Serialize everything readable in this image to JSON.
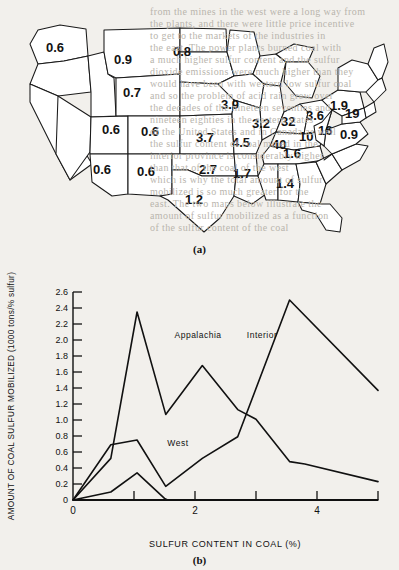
{
  "page": {
    "background_color": "#f2f0ec",
    "ink_color": "#121212",
    "bleed_through_lines": [
      {
        "text": "from the mines in the west were a long way from",
        "x": 150,
        "y": 6
      },
      {
        "text": "the plants, and there were little price incentive",
        "x": 150,
        "y": 18
      },
      {
        "text": "to get to the markets of the industries in",
        "x": 150,
        "y": 30
      },
      {
        "text": "the east. The power plants burned coal with",
        "x": 150,
        "y": 42
      },
      {
        "text": "a much higher sulfur content and the sulfur",
        "x": 150,
        "y": 54
      },
      {
        "text": "dioxide emissions were much higher than they",
        "x": 150,
        "y": 66
      },
      {
        "text": "would have been with western low sulfur coal",
        "x": 150,
        "y": 78
      },
      {
        "text": "and so the problem of acid rain grew over",
        "x": 150,
        "y": 90
      },
      {
        "text": "the decades of the nineteen seventies and",
        "x": 150,
        "y": 102
      },
      {
        "text": "nineteen eighties in the eastern states",
        "x": 150,
        "y": 114
      },
      {
        "text": "of the United States and in Canada as well",
        "x": 150,
        "y": 126
      },
      {
        "text": "the sulfur content of coal mined in the",
        "x": 150,
        "y": 138
      },
      {
        "text": "interior province is considerably higher",
        "x": 150,
        "y": 150
      },
      {
        "text": "than that of the coal of the west",
        "x": 150,
        "y": 162
      },
      {
        "text": "which is why the total amount of sulfur",
        "x": 150,
        "y": 174
      },
      {
        "text": "mobilized is so much greater for the",
        "x": 150,
        "y": 186
      },
      {
        "text": "east. The two maps below illustrate the",
        "x": 150,
        "y": 198
      },
      {
        "text": "amount of sulfur mobilized as a function",
        "x": 150,
        "y": 210
      },
      {
        "text": "of the sulfur content of the coal",
        "x": 150,
        "y": 222
      }
    ]
  },
  "map": {
    "panel_label": "(a)",
    "title_description": "Map of the contiguous United States with sulfur values printed on states",
    "state_values": [
      {
        "state": "Washington",
        "value": "0.6",
        "x": 46,
        "y": 44
      },
      {
        "state": "Montana",
        "value": "0.9",
        "x": 114,
        "y": 56
      },
      {
        "state": "North Dakota",
        "value": "0.8",
        "x": 173,
        "y": 48
      },
      {
        "state": "Idaho",
        "value": "0.7",
        "x": 123,
        "y": 89
      },
      {
        "state": "Utah",
        "value": "0.6",
        "x": 102,
        "y": 126
      },
      {
        "state": "Colorado",
        "value": "0.6",
        "x": 141,
        "y": 128
      },
      {
        "state": "Arizona",
        "value": "0.6",
        "x": 93,
        "y": 166
      },
      {
        "state": "New Mexico",
        "value": "0.6",
        "x": 137,
        "y": 168
      },
      {
        "state": "South Dakota",
        "value": "3.9",
        "x": 221,
        "y": 101
      },
      {
        "state": "Nebraska",
        "value": "3.7",
        "x": 196,
        "y": 134
      },
      {
        "state": "Iowa",
        "value": "4.5",
        "x": 232,
        "y": 139
      },
      {
        "state": "Kansas",
        "value": "2.7",
        "x": 199,
        "y": 166
      },
      {
        "state": "Missouri",
        "value": "1.7",
        "x": 233,
        "y": 170
      },
      {
        "state": "Texas",
        "value": "1.2",
        "x": 185,
        "y": 196
      },
      {
        "state": "Illinois",
        "value": "3.2",
        "x": 252,
        "y": 120
      },
      {
        "state": "Indiana",
        "value": "32",
        "x": 281,
        "y": 118
      },
      {
        "state": "Ohio",
        "value": "3.6",
        "x": 306,
        "y": 112
      },
      {
        "state": "Kentucky",
        "value": "40",
        "x": 272,
        "y": 141
      },
      {
        "state": "West Virginia",
        "value": "10",
        "x": 299,
        "y": 133
      },
      {
        "state": "Virginia",
        "value": "16",
        "x": 318,
        "y": 127
      },
      {
        "state": "Pennsylvania",
        "value": "1.9",
        "x": 330,
        "y": 102
      },
      {
        "state": "New York",
        "value": "19",
        "x": 345,
        "y": 110
      },
      {
        "state": "North Carolina",
        "value": "0.9",
        "x": 340,
        "y": 131
      },
      {
        "state": "Tennessee",
        "value": "1.6",
        "x": 283,
        "y": 150
      },
      {
        "state": "Alabama",
        "value": "1.4",
        "x": 276,
        "y": 180
      }
    ]
  },
  "chart_data": {
    "type": "line",
    "panel_label": "(b)",
    "title": "",
    "xlabel": "SULFUR CONTENT IN COAL (%)",
    "ylabel": "AMOUNT OF COAL SULFUR MOBILIZED (1000 tons/% sulfur)",
    "xlim": [
      0,
      5
    ],
    "ylim": [
      0,
      2.6
    ],
    "xticks": [
      0,
      1,
      2,
      3,
      4,
      5
    ],
    "xtick_labels": [
      "0",
      "",
      "2",
      "",
      "4",
      ""
    ],
    "yticks": [
      0,
      0.2,
      0.4,
      0.6,
      0.8,
      1.0,
      1.2,
      1.4,
      1.6,
      1.8,
      2.0,
      2.2,
      2.4,
      2.6
    ],
    "ytick_labels": [
      "0",
      "0.2",
      "0.4",
      "0.6",
      "0.8",
      "1.0",
      "1.2",
      "1.4",
      "1.6",
      "1.8",
      "2.0",
      "2.2",
      "2.4",
      "2.6"
    ],
    "grid": false,
    "legend_position": "inline-annotations",
    "series": [
      {
        "name": "Appalachia",
        "label_x": 2.05,
        "label_y": 2.02,
        "points": [
          {
            "x": 0.0,
            "y": 0.0
          },
          {
            "x": 0.62,
            "y": 0.52
          },
          {
            "x": 1.05,
            "y": 2.35
          },
          {
            "x": 1.52,
            "y": 1.07
          },
          {
            "x": 2.12,
            "y": 1.68
          },
          {
            "x": 2.7,
            "y": 1.13
          },
          {
            "x": 3.0,
            "y": 1.01
          },
          {
            "x": 3.55,
            "y": 0.48
          },
          {
            "x": 3.8,
            "y": 0.45
          },
          {
            "x": 5.0,
            "y": 0.23
          }
        ]
      },
      {
        "name": "Interior",
        "label_x": 3.1,
        "label_y": 2.02,
        "points": [
          {
            "x": 0.0,
            "y": 0.0
          },
          {
            "x": 0.62,
            "y": 0.69
          },
          {
            "x": 1.05,
            "y": 0.75
          },
          {
            "x": 1.52,
            "y": 0.17
          },
          {
            "x": 2.12,
            "y": 0.52
          },
          {
            "x": 2.7,
            "y": 0.79
          },
          {
            "x": 3.55,
            "y": 2.5
          },
          {
            "x": 5.0,
            "y": 1.37
          }
        ]
      },
      {
        "name": "West",
        "label_x": 1.72,
        "label_y": 0.67,
        "points": [
          {
            "x": 0.0,
            "y": 0.0
          },
          {
            "x": 0.62,
            "y": 0.1
          },
          {
            "x": 1.05,
            "y": 0.34
          },
          {
            "x": 1.5,
            "y": 0.02
          },
          {
            "x": 1.55,
            "y": 0.0
          },
          {
            "x": 5.0,
            "y": 0.0
          }
        ]
      }
    ]
  }
}
